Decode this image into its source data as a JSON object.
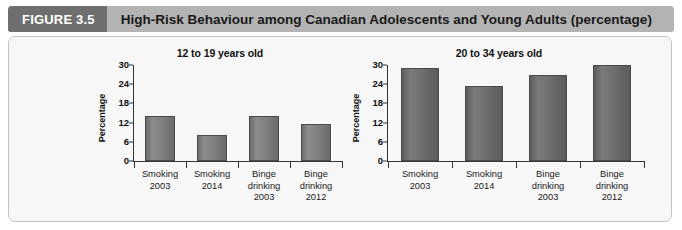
{
  "header": {
    "figure_tag": "FIGURE 3.5",
    "title": "High-Risk Behaviour among Canadian Adolescents and Young Adults (percentage)",
    "tag_color": "#6f6f6f",
    "bar_color": "#b3b3b3"
  },
  "panel": {
    "background": "#f7f7f7",
    "border_color": "#c4c4c4"
  },
  "chart_data": [
    {
      "type": "bar",
      "title": "12 to 19 years old",
      "xlabel": "",
      "ylabel": "Percentage",
      "categories": [
        "Smoking\n2003",
        "Smoking\n2014",
        "Binge\ndrinking\n2003",
        "Binge\ndrinking\n2012"
      ],
      "category_lines": [
        [
          "Smoking",
          "2003"
        ],
        [
          "Smoking",
          "2014"
        ],
        [
          "Binge",
          "drinking",
          "2003"
        ],
        [
          "Binge",
          "drinking",
          "2012"
        ]
      ],
      "values": [
        14,
        8,
        14,
        11.5
      ],
      "yticks": [
        0,
        6,
        12,
        18,
        24,
        30
      ],
      "ylim": [
        0,
        30
      ],
      "grid": false,
      "legend": false,
      "bar_color": "#7d7d7d"
    },
    {
      "type": "bar",
      "title": "20 to 34 years old",
      "xlabel": "",
      "ylabel": "Percentage",
      "categories": [
        "Smoking\n2003",
        "Smoking\n2014",
        "Binge\ndrinking\n2003",
        "Binge\ndrinking\n2012"
      ],
      "category_lines": [
        [
          "Smoking",
          "2003"
        ],
        [
          "Smoking",
          "2014"
        ],
        [
          "Binge",
          "drinking",
          "2003"
        ],
        [
          "Binge",
          "drinking",
          "2012"
        ]
      ],
      "values": [
        29,
        23.5,
        27,
        30
      ],
      "yticks": [
        0,
        6,
        12,
        18,
        24,
        30
      ],
      "ylim": [
        0,
        30
      ],
      "grid": false,
      "legend": false,
      "bar_color": "#6c6c6c"
    }
  ]
}
